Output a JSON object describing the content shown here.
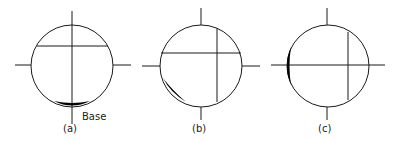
{
  "figure": {
    "panels": [
      {
        "label": "(a)",
        "annotation": "Base",
        "description": "Circle with vertical axis through center, horizontal chord near top, shaded crescent at bottom"
      },
      {
        "label": "(b)",
        "description": "Circle with horizontal chord and vertical chord right of center, shaded crescent at lower-left"
      },
      {
        "label": "(c)",
        "description": "Circle with horizontal axis through center, vertical chord near right, shaded crescent at left"
      }
    ],
    "colors": {
      "stroke": "#1a1a1a",
      "fill": "#000000",
      "background": "#ffffff"
    }
  }
}
